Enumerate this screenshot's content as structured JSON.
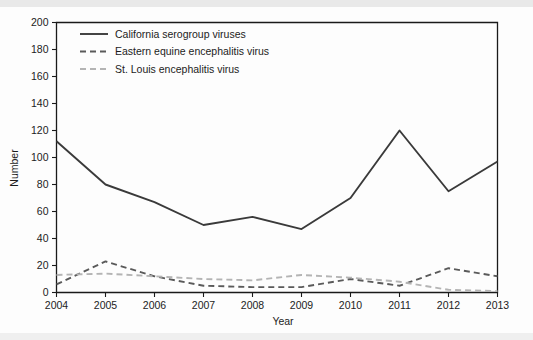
{
  "chart_data": {
    "type": "line",
    "title": "",
    "xlabel": "Year",
    "ylabel": "Number",
    "categories": [
      2004,
      2005,
      2006,
      2007,
      2008,
      2009,
      2010,
      2011,
      2012,
      2013
    ],
    "xtick_labels": [
      "2004",
      "2005",
      "2006",
      "2007",
      "2008",
      "2009",
      "2010",
      "2011",
      "2012",
      "2013"
    ],
    "ytick_labels": [
      "0",
      "20",
      "40",
      "60",
      "80",
      "100",
      "120",
      "140",
      "160",
      "180",
      "200"
    ],
    "ytick_values": [
      0,
      20,
      40,
      60,
      80,
      100,
      120,
      140,
      160,
      180,
      200
    ],
    "ylim": [
      0,
      200
    ],
    "xlim": [
      2004,
      2013
    ],
    "grid": false,
    "legend_position": "top-left",
    "series": [
      {
        "name": "California serogroup viruses",
        "style": "solid",
        "color": "#3a3a3a",
        "values": [
          112,
          80,
          67,
          50,
          56,
          47,
          70,
          120,
          75,
          97
        ]
      },
      {
        "name": "Eastern equine encephalitis virus",
        "style": "dashed",
        "color": "#5a5a5a",
        "values": [
          6,
          23,
          12,
          5,
          4,
          4,
          10,
          5,
          18,
          12
        ]
      },
      {
        "name": "St. Louis encephalitis virus",
        "style": "dashed-light",
        "color": "#b4b4b4",
        "values": [
          13,
          14,
          12,
          10,
          9,
          13,
          11,
          8,
          2,
          1
        ]
      }
    ]
  },
  "axes": {
    "y_title": "Number",
    "x_title": "Year"
  },
  "legend": {
    "items": [
      {
        "label": "California serogroup viruses"
      },
      {
        "label": "Eastern equine encephalitis virus"
      },
      {
        "label": "St. Louis encephalitis virus"
      }
    ]
  },
  "caption": {
    "partial_text": ""
  }
}
